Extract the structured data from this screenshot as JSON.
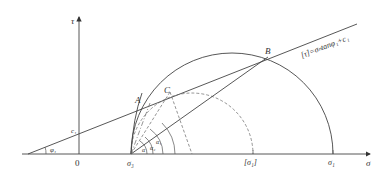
{
  "figure": {
    "type": "Mohr circle diagram with strength envelope",
    "axes": {
      "x_label": "σ",
      "y_label": "τ",
      "origin_label": "0"
    },
    "envelope": {
      "label": "[τ]=σₙtanφ₁+c₁",
      "intercept_label": "c₁",
      "angle_label": "φ₁"
    },
    "points": {
      "A": "A",
      "B": "B",
      "C": "C"
    },
    "axis_ticks": {
      "sigma3": "σ₃",
      "sigma1_allow": "[σ₁]",
      "sigma1": "σ₁"
    },
    "angles": {
      "alpha1": "α₁",
      "alpha2": "α₂",
      "alpha3": "α",
      "alpha4": "α₀"
    },
    "circles": [
      {
        "name": "failure-circle",
        "style": "solid",
        "from": "σ₃",
        "to": "σ₁"
      },
      {
        "name": "allowable-circle",
        "style": "dashed",
        "from": "σ₃",
        "to": "[σ₁]"
      }
    ]
  }
}
